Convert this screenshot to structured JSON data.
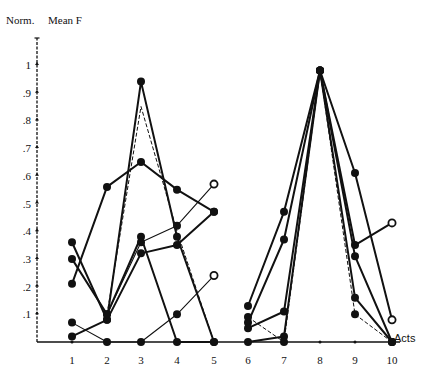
{
  "chart_data": {
    "type": "line",
    "title": "",
    "ylabel_left": "Norm.",
    "ylabel_right": "Mean F",
    "xlabel": "Acts",
    "x": [
      1,
      2,
      3,
      4,
      5,
      6,
      7,
      8,
      9,
      10
    ],
    "xticks": [
      "1",
      "2",
      "3",
      "4",
      "5",
      "6",
      "7",
      "8",
      "9",
      "10"
    ],
    "yticks": [
      ".1",
      ".2",
      ".3",
      ".4",
      ".5",
      ".6",
      ".7",
      ".8",
      ".9",
      "1"
    ],
    "ylim": [
      0,
      1.1
    ],
    "grid": false,
    "legend": null,
    "groups": [
      {
        "name": "Acts 1-5",
        "series": [
          {
            "x": [
              1,
              2,
              3,
              4,
              5
            ],
            "y": [
              0.21,
              0.56,
              0.65,
              0.55,
              0.47
            ],
            "style": "solid",
            "end": "filled"
          },
          {
            "x": [
              1,
              2,
              3,
              4,
              5
            ],
            "y": [
              0.36,
              0.08,
              0.32,
              0.35,
              0.47
            ],
            "style": "solid",
            "end": "filled"
          },
          {
            "x": [
              1,
              2,
              3,
              4,
              5
            ],
            "y": [
              0.3,
              0.1,
              0.38,
              0.0,
              0.0
            ],
            "style": "solid",
            "end": "filled"
          },
          {
            "x": [
              1,
              2,
              3,
              4,
              5
            ],
            "y": [
              0.07,
              0.0,
              0.0,
              0.1,
              0.24
            ],
            "style": "thin",
            "end": "open"
          },
          {
            "x": [
              1,
              2,
              3,
              4,
              5
            ],
            "y": [
              0.02,
              0.08,
              0.94,
              0.38,
              0.0
            ],
            "style": "solid",
            "end": "filled"
          },
          {
            "x": [
              2,
              3,
              4,
              5
            ],
            "y": [
              0.1,
              0.85,
              0.4,
              0.0
            ],
            "style": "dashed",
            "end": "none"
          },
          {
            "x": [
              2,
              3,
              4,
              5
            ],
            "y": [
              0.1,
              0.36,
              0.42,
              0.57
            ],
            "style": "thin",
            "end": "open"
          }
        ]
      },
      {
        "name": "Acts 6-10",
        "series": [
          {
            "x": [
              6,
              7,
              8,
              9,
              10
            ],
            "y": [
              0.13,
              0.47,
              0.98,
              0.61,
              0.08
            ],
            "style": "solid",
            "end": "open"
          },
          {
            "x": [
              6,
              7,
              8,
              9,
              10
            ],
            "y": [
              0.07,
              0.37,
              0.98,
              0.35,
              0.43
            ],
            "style": "solid",
            "end": "open"
          },
          {
            "x": [
              6,
              7,
              8,
              9,
              10
            ],
            "y": [
              0.05,
              0.11,
              0.98,
              0.31,
              0.0
            ],
            "style": "solid",
            "end": "filled"
          },
          {
            "x": [
              6,
              7,
              8,
              9,
              10
            ],
            "y": [
              0.0,
              0.02,
              0.98,
              0.16,
              0.0
            ],
            "style": "solid",
            "end": "filled"
          },
          {
            "x": [
              6,
              7,
              8,
              9,
              10
            ],
            "y": [
              0.09,
              0.0,
              0.98,
              0.1,
              0.0
            ],
            "style": "dashed",
            "end": "filled"
          }
        ]
      }
    ]
  },
  "labels": {
    "norm": "Norm.",
    "mean_f": "Mean F",
    "acts": "Acts"
  }
}
